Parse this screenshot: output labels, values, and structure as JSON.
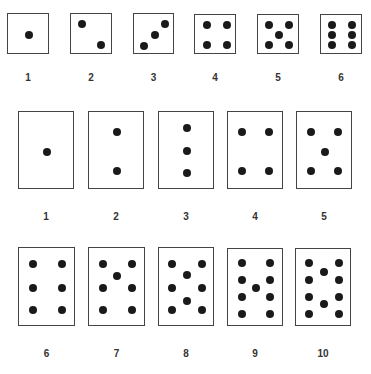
{
  "rows": [
    {
      "name": "square-dice-row",
      "cards": [
        {
          "label": "1",
          "x": 7,
          "y": 13,
          "w": 42,
          "h": 41,
          "dots": [
            [
              0.5,
              0.5
            ]
          ]
        },
        {
          "label": "2",
          "x": 70,
          "y": 13,
          "w": 42,
          "h": 41,
          "dots": [
            [
              0.25,
              0.25
            ],
            [
              0.72,
              0.75
            ]
          ]
        },
        {
          "label": "3",
          "x": 133,
          "y": 13,
          "w": 41,
          "h": 41,
          "dots": [
            [
              0.25,
              0.78
            ],
            [
              0.5,
              0.5
            ],
            [
              0.75,
              0.25
            ]
          ]
        },
        {
          "label": "4",
          "x": 194,
          "y": 14,
          "w": 42,
          "h": 40,
          "dots": [
            [
              0.28,
              0.25
            ],
            [
              0.75,
              0.25
            ],
            [
              0.28,
              0.75
            ],
            [
              0.75,
              0.75
            ]
          ]
        },
        {
          "label": "5",
          "x": 257,
          "y": 14,
          "w": 42,
          "h": 40,
          "dots": [
            [
              0.27,
              0.25
            ],
            [
              0.73,
              0.25
            ],
            [
              0.5,
              0.5
            ],
            [
              0.27,
              0.75
            ],
            [
              0.73,
              0.75
            ]
          ]
        },
        {
          "label": "6",
          "x": 320,
          "y": 14,
          "w": 42,
          "h": 40,
          "dots": [
            [
              0.27,
              0.25
            ],
            [
              0.73,
              0.25
            ],
            [
              0.27,
              0.5
            ],
            [
              0.73,
              0.5
            ],
            [
              0.27,
              0.75
            ],
            [
              0.73,
              0.75
            ]
          ]
        }
      ],
      "label_y": 72
    },
    {
      "name": "tall-card-row-1",
      "cards": [
        {
          "label": "1",
          "x": 18,
          "y": 111,
          "w": 56,
          "h": 78,
          "dots": [
            [
              0.5,
              0.51
            ]
          ]
        },
        {
          "label": "2",
          "x": 88,
          "y": 111,
          "w": 56,
          "h": 78,
          "dots": [
            [
              0.5,
              0.26
            ],
            [
              0.5,
              0.76
            ]
          ]
        },
        {
          "label": "3",
          "x": 158,
          "y": 111,
          "w": 56,
          "h": 78,
          "dots": [
            [
              0.5,
              0.2
            ],
            [
              0.5,
              0.5
            ],
            [
              0.5,
              0.78
            ]
          ]
        },
        {
          "label": "4",
          "x": 227,
          "y": 111,
          "w": 56,
          "h": 78,
          "dots": [
            [
              0.25,
              0.26
            ],
            [
              0.74,
              0.26
            ],
            [
              0.25,
              0.76
            ],
            [
              0.74,
              0.76
            ]
          ]
        },
        {
          "label": "5",
          "x": 296,
          "y": 111,
          "w": 56,
          "h": 78,
          "dots": [
            [
              0.25,
              0.26
            ],
            [
              0.74,
              0.26
            ],
            [
              0.5,
              0.51
            ],
            [
              0.25,
              0.76
            ],
            [
              0.74,
              0.76
            ]
          ]
        }
      ],
      "label_y": 211
    },
    {
      "name": "tall-card-row-2",
      "cards": [
        {
          "label": "6",
          "x": 18,
          "y": 247,
          "w": 57,
          "h": 79,
          "dots": [
            [
              0.24,
              0.2
            ],
            [
              0.76,
              0.2
            ],
            [
              0.24,
              0.5
            ],
            [
              0.76,
              0.5
            ],
            [
              0.24,
              0.78
            ],
            [
              0.76,
              0.78
            ]
          ]
        },
        {
          "label": "7",
          "x": 88,
          "y": 247,
          "w": 57,
          "h": 79,
          "dots": [
            [
              0.24,
              0.2
            ],
            [
              0.76,
              0.2
            ],
            [
              0.49,
              0.35
            ],
            [
              0.24,
              0.51
            ],
            [
              0.76,
              0.51
            ],
            [
              0.24,
              0.79
            ],
            [
              0.76,
              0.79
            ]
          ]
        },
        {
          "label": "8",
          "x": 158,
          "y": 247,
          "w": 56,
          "h": 79,
          "dots": [
            [
              0.24,
              0.2
            ],
            [
              0.76,
              0.2
            ],
            [
              0.5,
              0.34
            ],
            [
              0.24,
              0.51
            ],
            [
              0.76,
              0.51
            ],
            [
              0.5,
              0.67
            ],
            [
              0.24,
              0.79
            ],
            [
              0.76,
              0.79
            ]
          ]
        },
        {
          "label": "9",
          "x": 227,
          "y": 248,
          "w": 56,
          "h": 78,
          "dots": [
            [
              0.25,
              0.18
            ],
            [
              0.75,
              0.18
            ],
            [
              0.25,
              0.4
            ],
            [
              0.75,
              0.4
            ],
            [
              0.5,
              0.5
            ],
            [
              0.25,
              0.61
            ],
            [
              0.75,
              0.61
            ],
            [
              0.25,
              0.83
            ],
            [
              0.75,
              0.83
            ]
          ]
        },
        {
          "label": "10",
          "x": 295,
          "y": 248,
          "w": 56,
          "h": 78,
          "dots": [
            [
              0.24,
              0.18
            ],
            [
              0.76,
              0.18
            ],
            [
              0.5,
              0.3
            ],
            [
              0.24,
              0.4
            ],
            [
              0.76,
              0.4
            ],
            [
              0.24,
              0.61
            ],
            [
              0.76,
              0.61
            ],
            [
              0.5,
              0.71
            ],
            [
              0.24,
              0.83
            ],
            [
              0.76,
              0.83
            ]
          ]
        }
      ],
      "label_y": 348
    }
  ],
  "colors": {
    "dot": "#1a1a1a",
    "border": "#444444",
    "label": "#333333"
  }
}
